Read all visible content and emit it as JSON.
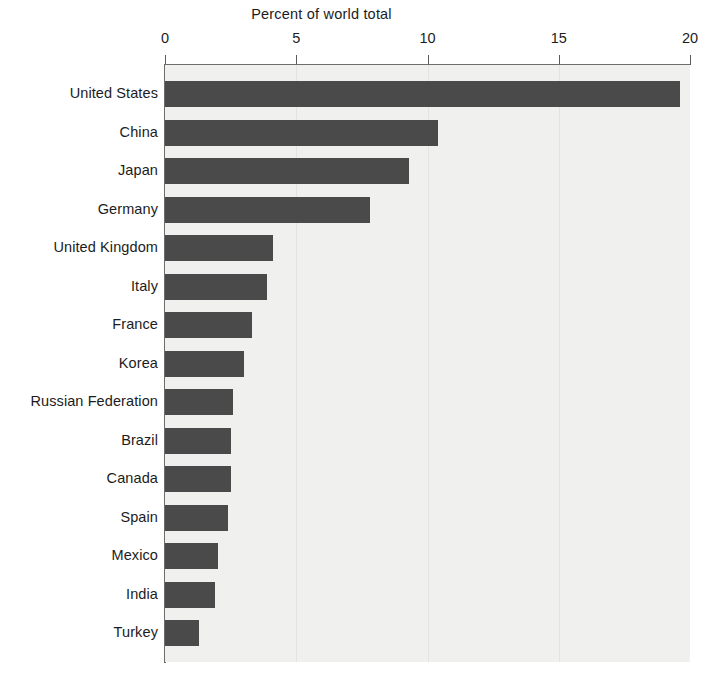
{
  "chart_data": {
    "type": "bar",
    "orientation": "horizontal",
    "title": "Percent of world total",
    "xlabel": "Percent of world total",
    "ylabel": "",
    "xlim": [
      0,
      20
    ],
    "xticks": [
      0,
      5,
      10,
      15,
      20
    ],
    "xtick_labels": [
      "0",
      "5",
      "10",
      "15",
      "20"
    ],
    "grid": "vertical-light",
    "legend": "none",
    "bar_color": "#4a4a4a",
    "plot_background": "#f0f0ee",
    "categories": [
      "United States",
      "China",
      "Japan",
      "Germany",
      "United Kingdom",
      "Italy",
      "France",
      "Korea",
      "Russian Federation",
      "Brazil",
      "Canada",
      "Spain",
      "Mexico",
      "India",
      "Turkey"
    ],
    "values": [
      19.6,
      10.4,
      9.3,
      7.8,
      4.1,
      3.9,
      3.3,
      3.0,
      2.6,
      2.5,
      2.5,
      2.4,
      2.0,
      1.9,
      1.3
    ]
  }
}
